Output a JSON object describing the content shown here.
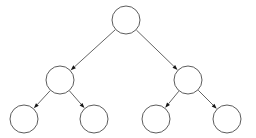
{
  "diagram": {
    "type": "tree",
    "background_color": "#ffffff",
    "node_fill_color": "#ffffff",
    "node_stroke_color": "#4a4a4a",
    "edge_color": "#3c3c3c",
    "arrowhead_color": "#161616",
    "node_radius": 14,
    "depth": 3,
    "node_count": 7,
    "edge_count": 6,
    "nodes": [
      {
        "id": "root",
        "label": "",
        "cx": 126,
        "cy": 20,
        "r": 14,
        "level": 0
      },
      {
        "id": "l",
        "label": "",
        "cx": 60,
        "cy": 80,
        "r": 14,
        "level": 1
      },
      {
        "id": "r",
        "label": "",
        "cx": 188,
        "cy": 80,
        "r": 14,
        "level": 1
      },
      {
        "id": "ll",
        "label": "",
        "cx": 24,
        "cy": 119,
        "r": 14,
        "level": 2
      },
      {
        "id": "lr",
        "label": "",
        "cx": 94,
        "cy": 119,
        "r": 14,
        "level": 2
      },
      {
        "id": "rl",
        "label": "",
        "cx": 156,
        "cy": 119,
        "r": 14,
        "level": 2
      },
      {
        "id": "rr",
        "label": "",
        "cx": 227,
        "cy": 119,
        "r": 14,
        "level": 2
      }
    ],
    "edges": [
      {
        "id": "root-l",
        "from": "root",
        "to": "l",
        "directed": true
      },
      {
        "id": "root-r",
        "from": "root",
        "to": "r",
        "directed": true
      },
      {
        "id": "l-ll",
        "from": "l",
        "to": "ll",
        "directed": true
      },
      {
        "id": "l-lr",
        "from": "l",
        "to": "lr",
        "directed": true
      },
      {
        "id": "r-rl",
        "from": "r",
        "to": "rl",
        "directed": true
      },
      {
        "id": "r-rr",
        "from": "r",
        "to": "rr",
        "directed": true
      }
    ]
  }
}
